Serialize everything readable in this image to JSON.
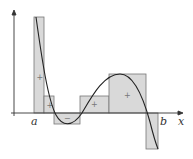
{
  "diagram": {
    "labels": {
      "a": "a",
      "b": "b",
      "x_axis": "x"
    },
    "rectangles": [
      {
        "x0": 34,
        "x1": 44,
        "top": 17,
        "sign": "+"
      },
      {
        "x0": 44,
        "x1": 54,
        "top": 96,
        "sign": "+"
      },
      {
        "x0": 54,
        "x1": 80,
        "top": 124,
        "sign": "−"
      },
      {
        "x0": 80,
        "x1": 109,
        "top": 96,
        "sign": "+"
      },
      {
        "x0": 109,
        "x1": 146,
        "top": 74,
        "sign": "+"
      },
      {
        "x0": 146,
        "x1": 158,
        "top": 149,
        "sign": "−"
      }
    ],
    "colors": {
      "rect_fill": "#d9d9d9",
      "rect_stroke": "#777777",
      "curve": "#222222",
      "axis": "#333333"
    }
  }
}
